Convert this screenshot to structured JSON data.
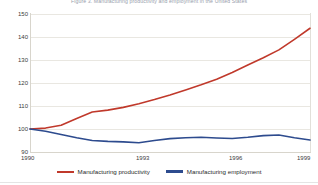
{
  "chart_data": {
    "type": "line",
    "title": "Figure 3. Manufacturing productivity and employment in the United States",
    "subtitle": "",
    "xlabel": "",
    "ylabel": "",
    "index_base": "1990 = 100",
    "grid": true,
    "legend_position": "bottom",
    "xlim": [
      1990,
      1999
    ],
    "ylim": [
      90,
      150
    ],
    "ytick_labels": [
      "90",
      "100",
      "110",
      "120",
      "130",
      "140",
      "150"
    ],
    "ytick_values": [
      90,
      100,
      110,
      120,
      130,
      140,
      150
    ],
    "xtick_labels": [
      "1990",
      "1993",
      "1996",
      "1999"
    ],
    "xtick_values": [
      1990,
      1993,
      1996,
      1999
    ],
    "x": [
      1990,
      1990.5,
      1991,
      1991.5,
      1992,
      1992.5,
      1993,
      1993.5,
      1994,
      1994.5,
      1995,
      1995.5,
      1996,
      1996.5,
      1997,
      1997.5,
      1998,
      1998.5,
      1999
    ],
    "series": [
      {
        "name": "Manufacturing productivity",
        "color": "#c0392b",
        "values": [
          100.0,
          100.4,
          101.6,
          104.6,
          107.4,
          108.2,
          109.4,
          111.0,
          112.8,
          114.8,
          117.0,
          119.2,
          121.6,
          124.6,
          127.8,
          131.0,
          134.4,
          139.0,
          143.8
        ]
      },
      {
        "name": "Manufacturing employment",
        "color": "#2d4b8e",
        "values": [
          100.0,
          99.0,
          97.6,
          96.2,
          95.0,
          94.6,
          94.4,
          94.0,
          95.0,
          95.8,
          96.2,
          96.4,
          96.1,
          95.9,
          96.4,
          97.1,
          97.4,
          96.2,
          95.2
        ]
      }
    ]
  },
  "legend": {
    "items": [
      {
        "label": "Manufacturing productivity",
        "color": "#c0392b"
      },
      {
        "label": "Manufacturing employment",
        "color": "#2d4b8e"
      }
    ]
  }
}
